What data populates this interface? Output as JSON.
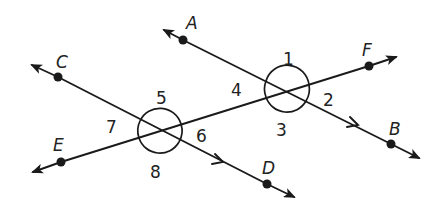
{
  "diagram": {
    "type": "geometry",
    "stroke_color": "#1a1a1a",
    "background": "#ffffff",
    "points": {
      "A": "A",
      "B": "B",
      "C": "C",
      "D": "D",
      "E": "E",
      "F": "F"
    },
    "angles": {
      "a1": "1",
      "a2": "2",
      "a3": "3",
      "a4": "4",
      "a5": "5",
      "a6": "6",
      "a7": "7",
      "a8": "8"
    },
    "lines": [
      {
        "name": "AB",
        "through": [
          "A",
          "B"
        ],
        "parallel_mark": true
      },
      {
        "name": "CD",
        "through": [
          "C",
          "D"
        ],
        "parallel_mark": true
      },
      {
        "name": "EF",
        "through": [
          "E",
          "F"
        ],
        "transversal": true
      }
    ],
    "intersections": [
      {
        "lines": [
          "AB",
          "EF"
        ],
        "angles": [
          "1",
          "2",
          "3",
          "4"
        ]
      },
      {
        "lines": [
          "CD",
          "EF"
        ],
        "angles": [
          "5",
          "6",
          "7",
          "8"
        ]
      }
    ]
  }
}
